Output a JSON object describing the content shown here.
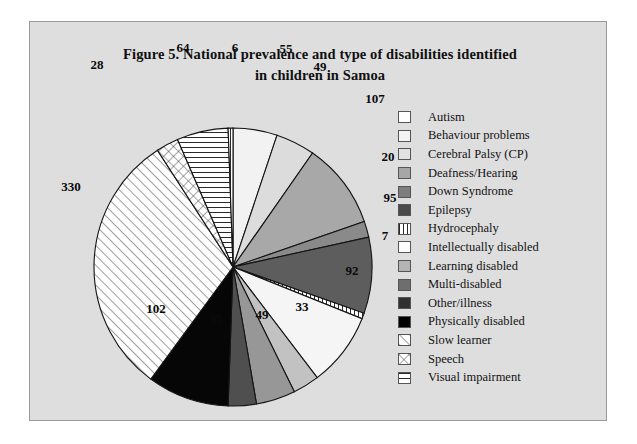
{
  "figure": {
    "title_line1": "Figure 5.  National prevalence and type of disabilities identified",
    "title_line2": "in children in Samoa"
  },
  "chart_data": {
    "type": "pie",
    "title": "Figure 5.  National prevalence and type of disabilities identified in children in Samoa",
    "total": 942,
    "start_angle_deg": 0,
    "direction": "clockwise",
    "legend_position": "right",
    "categories": [
      "Autism",
      "Behaviour problems",
      "Cerebral Palsy (CP)",
      "Deafness/Hearing",
      "Down Syndrome",
      "Epilepsy",
      "Hydrocephaly",
      "Intellectually disabled",
      "Learning disabled",
      "Multi-disabled",
      "Other/illness",
      "Physically disabled",
      "Slow learner",
      "Speech",
      "Visual impairment"
    ],
    "values": [
      55,
      49,
      107,
      20,
      95,
      7,
      92,
      33,
      49,
      35,
      102,
      330,
      28,
      64,
      6
    ],
    "slices": [
      {
        "label": "Autism",
        "value": 55,
        "fill": "#f2f2f2",
        "pattern": "solid",
        "label_x": 256,
        "label_y": 27
      },
      {
        "label": "Behaviour problems",
        "value": 49,
        "fill": "#dcdcdc",
        "pattern": "solid",
        "label_x": 290,
        "label_y": 45
      },
      {
        "label": "Cerebral Palsy (CP)",
        "value": 107,
        "fill": "#a8a8a8",
        "pattern": "solid",
        "label_x": 345,
        "label_y": 77
      },
      {
        "label": "Deafness/Hearing",
        "value": 20,
        "fill": "#8a8a8a",
        "pattern": "solid",
        "label_x": 358,
        "label_y": 135
      },
      {
        "label": "Down Syndrome",
        "value": 95,
        "fill": "#5d5d5d",
        "pattern": "solid",
        "label_x": 360,
        "label_y": 176
      },
      {
        "label": "Epilepsy",
        "value": 7,
        "fill": "#ffffff",
        "pattern": "vertical",
        "label_x": 355,
        "label_y": 214
      },
      {
        "label": "Hydrocephaly",
        "value": 92,
        "fill": "#f5f5f5",
        "pattern": "solid",
        "label_x": 322,
        "label_y": 249
      },
      {
        "label": "Intellectually disabled",
        "value": 33,
        "fill": "#c2c2c2",
        "pattern": "solid",
        "label_x": 272,
        "label_y": 285
      },
      {
        "label": "Learning disabled",
        "value": 49,
        "fill": "#979797",
        "pattern": "solid",
        "label_x": 232,
        "label_y": 293
      },
      {
        "label": "Multi-disabled",
        "value": 35,
        "fill": "#4f4f4f",
        "pattern": "solid",
        "label_x": 186,
        "label_y": 297
      },
      {
        "label": "Other/illness",
        "value": 102,
        "fill": "#060606",
        "pattern": "solid",
        "label_x": 126,
        "label_y": 287
      },
      {
        "label": "Physically disabled",
        "value": 330,
        "fill": "#ffffff",
        "pattern": "diagonal",
        "label_x": 41,
        "label_y": 165
      },
      {
        "label": "Slow learner",
        "value": 28,
        "fill": "#ffffff",
        "pattern": "crosshatch",
        "label_x": 67,
        "label_y": 43
      },
      {
        "label": "Speech",
        "value": 64,
        "fill": "#ffffff",
        "pattern": "horizontal",
        "label_x": 153,
        "label_y": 26
      },
      {
        "label": "Visual impairment",
        "value": 6,
        "fill": "#ffffff",
        "pattern": "vertical2",
        "label_x": 205,
        "label_y": 26
      }
    ]
  },
  "legend": {
    "items": [
      {
        "label": "Autism",
        "swatch": "#fefefe",
        "pattern": "solid"
      },
      {
        "label": "Behaviour problems",
        "swatch": "#f4f4f4",
        "pattern": "solid"
      },
      {
        "label": "Cerebral Palsy (CP)",
        "swatch": "#e2e2e2",
        "pattern": "solid"
      },
      {
        "label": "Deafness/Hearing",
        "swatch": "#a6a6a6",
        "pattern": "solid"
      },
      {
        "label": "Down Syndrome",
        "swatch": "#7d7d7d",
        "pattern": "solid"
      },
      {
        "label": "Epilepsy",
        "swatch": "#4a4a4a",
        "pattern": "solid"
      },
      {
        "label": "Hydrocephaly",
        "swatch": "#ffffff",
        "pattern": "vertical"
      },
      {
        "label": "Intellectually disabled",
        "swatch": "#fcfcfc",
        "pattern": "solid"
      },
      {
        "label": "Learning disabled",
        "swatch": "#b4b4b4",
        "pattern": "solid"
      },
      {
        "label": "Multi-disabled",
        "swatch": "#6e6e6e",
        "pattern": "solid"
      },
      {
        "label": "Other/illness",
        "swatch": "#313131",
        "pattern": "solid"
      },
      {
        "label": "Physically disabled",
        "swatch": "#000000",
        "pattern": "solid"
      },
      {
        "label": "Slow learner",
        "swatch": "#ffffff",
        "pattern": "diagonal"
      },
      {
        "label": "Speech",
        "swatch": "#ffffff",
        "pattern": "crosshatch"
      },
      {
        "label": "Visual impairment",
        "swatch": "#ffffff",
        "pattern": "horizontal"
      }
    ]
  }
}
